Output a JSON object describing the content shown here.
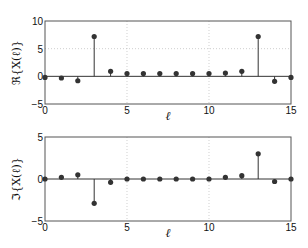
{
  "chart_data": [
    {
      "type": "stem",
      "title": "",
      "xlabel": "ℓ",
      "ylabel": "ℜ{X(ℓ)}",
      "xlim": [
        0,
        15
      ],
      "ylim": [
        -5,
        10
      ],
      "xticks": [
        "0",
        "5",
        "10",
        "15"
      ],
      "yticks": [
        "-5",
        "0",
        "5",
        "10"
      ],
      "grid": true,
      "x": [
        0,
        1,
        2,
        3,
        4,
        5,
        6,
        7,
        8,
        9,
        10,
        11,
        12,
        13,
        14,
        15
      ],
      "values": [
        -0.2,
        -0.3,
        -0.8,
        7.2,
        0.9,
        0.5,
        0.5,
        0.5,
        0.5,
        0.5,
        0.5,
        0.6,
        0.9,
        7.2,
        -0.9,
        -0.2
      ]
    },
    {
      "type": "stem",
      "title": "",
      "xlabel": "ℓ",
      "ylabel": "ℑ{X(ℓ)}",
      "xlim": [
        0,
        15
      ],
      "ylim": [
        -5,
        5
      ],
      "xticks": [
        "0",
        "5",
        "10",
        "15"
      ],
      "yticks": [
        "-5",
        "0",
        "5"
      ],
      "grid": true,
      "x": [
        0,
        1,
        2,
        3,
        4,
        5,
        6,
        7,
        8,
        9,
        10,
        11,
        12,
        13,
        14,
        15
      ],
      "values": [
        0,
        0.2,
        0.5,
        -2.9,
        -0.4,
        0,
        0,
        0,
        0,
        0,
        0,
        0.2,
        0.4,
        3.0,
        -0.3,
        0
      ]
    }
  ]
}
